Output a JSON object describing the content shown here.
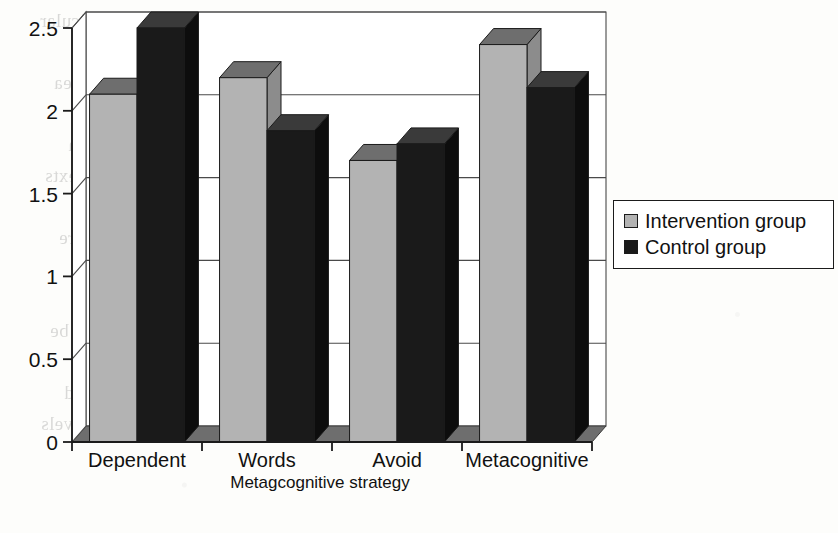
{
  "figure": {
    "kind": "3d-bar-chart",
    "scan_artifact": true
  },
  "chart_data": {
    "type": "bar",
    "title": "",
    "xlabel": "Metagcognitive strategy",
    "ylabel": "",
    "categories": [
      "Dependent",
      "Words",
      "Avoid",
      "Metacognitive"
    ],
    "series": [
      {
        "name": "Intervention group",
        "color": "#b3b3b3",
        "values": [
          2.1,
          2.2,
          1.7,
          2.4
        ]
      },
      {
        "name": "Control group",
        "color": "#1a1a1a",
        "values": [
          2.5,
          1.88,
          1.8,
          2.14
        ]
      }
    ],
    "yticks": [
      0,
      0.5,
      1,
      1.5,
      2,
      2.5
    ],
    "ytick_labels": [
      "0",
      "0.5",
      "1",
      "1.5",
      "2",
      "2.5"
    ],
    "ylim": [
      0,
      2.5
    ],
    "grid": true,
    "legend_position": "right",
    "style": "3d-perspective"
  },
  "legend": {
    "entries": [
      {
        "label": "Intervention group",
        "swatch": "#b3b3b3"
      },
      {
        "label": "Control group",
        "swatch": "#1a1a1a"
      }
    ]
  },
  "bleed_text": {
    "lines": [
      "with some of the students who fluency in particular",
      "and then a more intensive role, but  the poor literacy of",
      "at one which meant that they and enter into school lea",
      "to talk to them and what they story in the second gradu",
      "on the best one, we think that a moderate understandin",
      "be to focus on what is expected and the social contexts",
      "",
      "is a sense of the lack of attention on the written expre",
      "the possible",
      "However, building the student's prior knowledge through",
      "the skills of independent reading, with comprehension be",
      "the  4.2 strategy for the implementation of the program",
      "successive and  those that could be planned in the ind",
      "comprehension and the unobserved criteria of  the levels"
    ]
  }
}
